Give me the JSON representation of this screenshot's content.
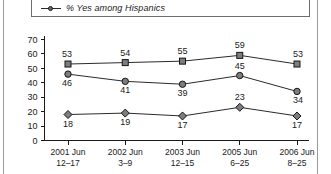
{
  "legend": {
    "marker": "circle-line-marker",
    "label": "% Yes among Hispanics"
  },
  "chart_data": {
    "type": "line",
    "title": "",
    "subtitle": "",
    "xlabel": "",
    "ylabel": "",
    "ylim": [
      0,
      70
    ],
    "yticks": [
      0,
      10,
      20,
      30,
      40,
      50,
      60,
      70
    ],
    "grid": false,
    "legend_position": "top",
    "categories": [
      "2001 Jun 12–17",
      "2002 Jun 3–9",
      "2003 Jun 12–15",
      "2005 Jun 6–25",
      "2006 Jun 8–25"
    ],
    "category_lines": [
      {
        "year": "2001 Jun",
        "days": "12–17"
      },
      {
        "year": "2002 Jun",
        "days": "3–9"
      },
      {
        "year": "2003 Jun",
        "days": "12–15"
      },
      {
        "year": "2005 Jun",
        "days": "6–25"
      },
      {
        "year": "2006 Jun",
        "days": "8–25"
      }
    ],
    "series": [
      {
        "name": "top-series",
        "marker": "square",
        "values": [
          53,
          54,
          55,
          59,
          53
        ]
      },
      {
        "name": "middle-series",
        "marker": "circle",
        "values": [
          46,
          41,
          39,
          45,
          34
        ]
      },
      {
        "name": "bottom-series",
        "marker": "diamond",
        "values": [
          18,
          19,
          17,
          23,
          17
        ]
      }
    ]
  },
  "colors": {
    "line": "#2b2b2b",
    "marker_fill": "#7d7d7d",
    "marker_stroke": "#161616",
    "axis": "#1a1a1a",
    "text": "#1a1a1a"
  }
}
